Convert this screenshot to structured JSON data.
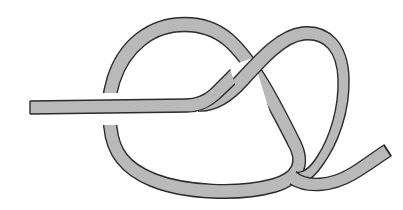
{
  "figure": {
    "title": "Knot Diagram",
    "kind": "line-drawing",
    "caption": "",
    "width": 403,
    "height": 210,
    "background_color": "#ffffff"
  },
  "rope": {
    "fill_color": "#b9b9b9",
    "outline_color": "#2b2b2b",
    "outline_width": 1.4,
    "band_width": 13,
    "end_cap_style": "flat-cut",
    "texture": "flat light-gray with subtle noise"
  },
  "strands": [
    {
      "id": "strand-left-tail",
      "label": "left free end",
      "description": "flat-cut end at the left edge running horizontally to the right"
    },
    {
      "id": "strand-left-loop",
      "label": "large left loop",
      "description": "big oval loop occupying the left two thirds of the figure"
    },
    {
      "id": "strand-right-loop",
      "label": "right loop",
      "description": "narrow tilted loop on the upper right"
    },
    {
      "id": "strand-right-tail",
      "label": "right free end",
      "description": "flat-cut end at the lower right curving up and to the right"
    }
  ],
  "crossings": [
    {
      "id": "crossing-left",
      "position": {
        "x": 112,
        "y": 110
      },
      "over": "strand-left-tail",
      "under": "strand-left-loop"
    },
    {
      "id": "crossing-center",
      "position": {
        "x": 245,
        "y": 82
      },
      "over": "strand-right-loop",
      "under": "strand-left-loop"
    },
    {
      "id": "crossing-lower-right",
      "position": {
        "x": 312,
        "y": 176
      },
      "over": "strand-right-loop",
      "under": "strand-left-loop"
    }
  ],
  "end_points": [
    {
      "id": "end-left",
      "x": 30,
      "y": 101,
      "orientation": "vertical flat cut"
    },
    {
      "id": "end-right",
      "x": 386,
      "y": 153,
      "orientation": "angled flat cut"
    }
  ]
}
